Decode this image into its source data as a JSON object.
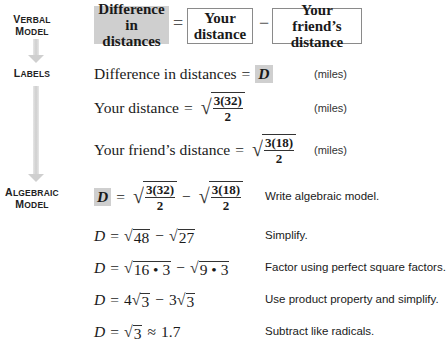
{
  "side_labels": {
    "verbal": {
      "line1_cap": "V",
      "line1_rest": "ERBAL",
      "line2_cap": "M",
      "line2_rest": "ODEL"
    },
    "labels": {
      "line1_cap": "L",
      "line1_rest": "ABELS"
    },
    "algebraic": {
      "line1_cap": "A",
      "line1_rest": "LGEBRAIC",
      "line2_cap": "M",
      "line2_rest": "ODEL"
    }
  },
  "verbal_model": {
    "term1": {
      "line1": "Difference",
      "line2": "in distances"
    },
    "op1": "=",
    "term2": {
      "line1": "Your",
      "line2": "distance"
    },
    "op2": "−",
    "term3": {
      "line1": "Your friend’s",
      "line2": "distance"
    }
  },
  "labels": [
    {
      "text": "Difference in distances",
      "eq": "=",
      "var": "D",
      "units": "(miles)"
    },
    {
      "text": "Your distance",
      "eq": "=",
      "num": "3(32)",
      "den": "2",
      "units": "(miles)"
    },
    {
      "text": "Your friend’s distance",
      "eq": "=",
      "num": "3(18)",
      "den": "2",
      "units": "(miles)"
    }
  ],
  "algebraic": [
    {
      "lhs": "D",
      "eq": "=",
      "num1": "3(32)",
      "den1": "2",
      "op": "−",
      "num2": "3(18)",
      "den2": "2",
      "desc": "Write algebraic model."
    },
    {
      "lhs": "D",
      "eq": "=",
      "r1": "48",
      "op": "−",
      "r2": "27",
      "desc": "Simplify."
    },
    {
      "lhs": "D",
      "eq": "=",
      "r1": "16 • 3",
      "op": "−",
      "r2": "9 • 3",
      "desc": "Factor using perfect square factors."
    },
    {
      "lhs": "D",
      "eq": "=",
      "c1": "4",
      "r1": "3",
      "op": "−",
      "c2": "3",
      "r2": "3",
      "desc": "Use product property and simplify."
    },
    {
      "lhs": "D",
      "eq": "=",
      "r1": "3",
      "approx": "≈",
      "value": "1.7",
      "desc": "Subtract like radicals."
    }
  ],
  "colors": {
    "highlight_gray": "#cfcfcf",
    "box_border": "#8a8a8a",
    "arrow_gray": "#cfcfcf"
  }
}
